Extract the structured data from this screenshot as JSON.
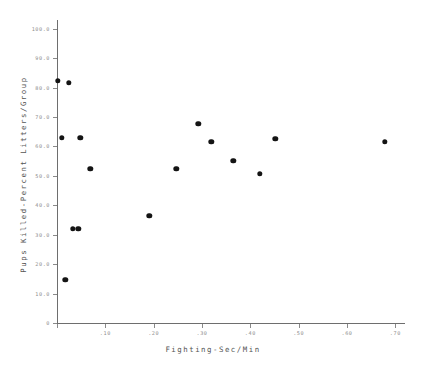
{
  "chart_data": {
    "type": "scatter",
    "title": "",
    "xlabel": "Fighting-Sec/Min",
    "ylabel": "Pups Killed-Percent Litters/Group",
    "xlim": [
      0,
      0.72
    ],
    "ylim": [
      0,
      103
    ],
    "xticks": [
      0,
      0.1,
      0.2,
      0.3,
      0.4,
      0.5,
      0.6,
      0.7
    ],
    "xtick_labels": [
      "",
      ".10",
      ".20",
      ".30",
      ".40",
      ".50",
      ".60",
      ".70"
    ],
    "yticks": [
      0,
      10,
      20,
      30,
      40,
      50,
      60,
      70,
      80,
      90,
      100
    ],
    "ytick_labels": [
      "0",
      "10.0",
      "20.0",
      "30.0",
      "40.0",
      "50.0",
      "60.0",
      "70.0",
      "80.0",
      "90.0",
      "100.0"
    ],
    "grid": false,
    "legend": null,
    "marker": "filled-circle",
    "marker_color": "#141414",
    "axis_color": "#6e6e6e",
    "points": [
      {
        "x": 0.002,
        "y": 82.3
      },
      {
        "x": 0.025,
        "y": 81.6
      },
      {
        "x": 0.01,
        "y": 62.9
      },
      {
        "x": 0.048,
        "y": 62.9
      },
      {
        "x": 0.069,
        "y": 52.4
      },
      {
        "x": 0.033,
        "y": 32.0
      },
      {
        "x": 0.044,
        "y": 32.0
      },
      {
        "x": 0.017,
        "y": 14.6
      },
      {
        "x": 0.191,
        "y": 36.4
      },
      {
        "x": 0.247,
        "y": 52.4
      },
      {
        "x": 0.292,
        "y": 67.7
      },
      {
        "x": 0.319,
        "y": 61.6
      },
      {
        "x": 0.365,
        "y": 55.1
      },
      {
        "x": 0.419,
        "y": 50.7
      },
      {
        "x": 0.452,
        "y": 62.6
      },
      {
        "x": 0.678,
        "y": 61.6
      }
    ]
  }
}
